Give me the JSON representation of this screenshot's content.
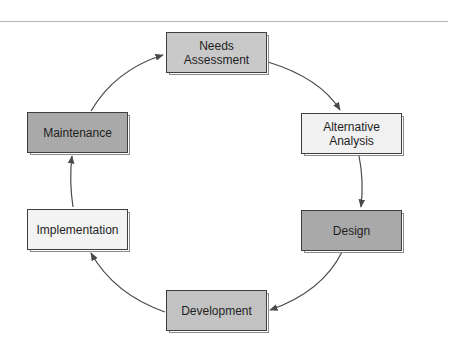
{
  "diagram": {
    "type": "cycle",
    "direction": "clockwise",
    "nodes": [
      {
        "id": "needs",
        "label": "Needs\nAssessment",
        "fill": "#c9c9c9"
      },
      {
        "id": "alternative",
        "label": "Alternative\nAnalysis",
        "fill": "#f1f1f1"
      },
      {
        "id": "design",
        "label": "Design",
        "fill": "#a9a9a9"
      },
      {
        "id": "development",
        "label": "Development",
        "fill": "#c2c2c2"
      },
      {
        "id": "implementation",
        "label": "Implementation",
        "fill": "#f3f3f3"
      },
      {
        "id": "maintenance",
        "label": "Maintenance",
        "fill": "#a9a9a9"
      }
    ],
    "edges": [
      {
        "from": "needs",
        "to": "alternative"
      },
      {
        "from": "alternative",
        "to": "design"
      },
      {
        "from": "design",
        "to": "development"
      },
      {
        "from": "development",
        "to": "implementation"
      },
      {
        "from": "implementation",
        "to": "maintenance"
      },
      {
        "from": "maintenance",
        "to": "needs"
      }
    ],
    "colors": {
      "border": "#3e3e3e",
      "arrow": "#4a4a4a",
      "rule": "#b4b4b4"
    }
  }
}
